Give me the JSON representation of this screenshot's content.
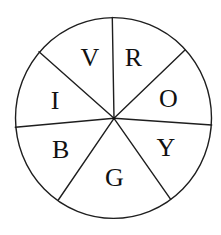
{
  "diagram": {
    "segments": [
      {
        "letter": "R",
        "meaning": "Red"
      },
      {
        "letter": "O",
        "meaning": "Orange"
      },
      {
        "letter": "Y",
        "meaning": "Yellow"
      },
      {
        "letter": "G",
        "meaning": "Green"
      },
      {
        "letter": "B",
        "meaning": "Blue"
      },
      {
        "letter": "I",
        "meaning": "Indigo"
      },
      {
        "letter": "V",
        "meaning": "Violet"
      }
    ]
  }
}
